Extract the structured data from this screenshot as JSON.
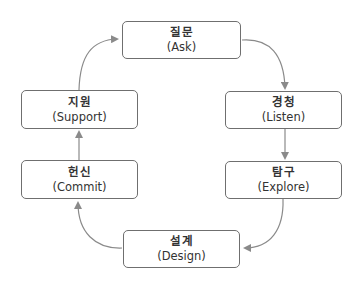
{
  "diagram": {
    "type": "cycle",
    "colors": {
      "border": "#6f6f6f",
      "arrow": "#8a8a8a",
      "text": "#333333"
    },
    "nodes": [
      {
        "id": "ask",
        "ko": "질문",
        "en": "(Ask)"
      },
      {
        "id": "listen",
        "ko": "경청",
        "en": "(Listen)"
      },
      {
        "id": "explore",
        "ko": "탐구",
        "en": "(Explore)"
      },
      {
        "id": "design",
        "ko": "설계",
        "en": "(Design)"
      },
      {
        "id": "commit",
        "ko": "헌신",
        "en": "(Commit)"
      },
      {
        "id": "support",
        "ko": "지원",
        "en": "(Support)"
      }
    ],
    "edges": [
      {
        "from": "ask",
        "to": "listen"
      },
      {
        "from": "listen",
        "to": "explore"
      },
      {
        "from": "explore",
        "to": "design"
      },
      {
        "from": "design",
        "to": "commit"
      },
      {
        "from": "commit",
        "to": "support"
      },
      {
        "from": "support",
        "to": "ask"
      }
    ]
  }
}
